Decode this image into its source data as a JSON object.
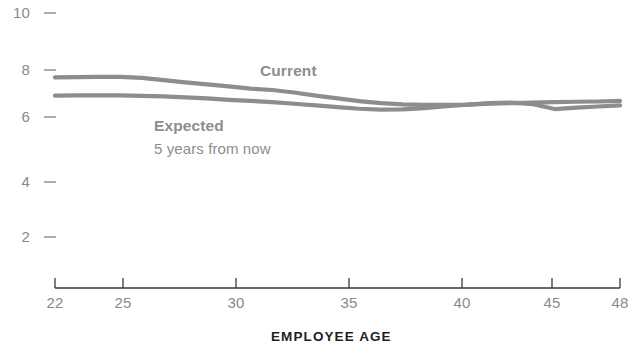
{
  "chart_data": {
    "type": "line",
    "title": "",
    "subtitle": "",
    "xlabel": "EMPLOYEE AGE",
    "ylabel": "",
    "xlim": [
      22,
      48
    ],
    "ylim": [
      0,
      10.6
    ],
    "grid": false,
    "legend_position": "inline-annotations",
    "x_ticks": [
      "22",
      "25",
      "30",
      "35",
      "40",
      "45",
      "48"
    ],
    "x_tick_values": [
      22,
      25,
      30,
      35,
      40,
      45,
      48
    ],
    "y_ticks": [
      "10",
      "8",
      "6",
      "4",
      "2"
    ],
    "y_tick_values": [
      10,
      8,
      6,
      4,
      2
    ],
    "x": [
      22,
      23,
      24,
      25,
      26,
      27,
      28,
      29,
      30,
      31,
      32,
      33,
      34,
      35,
      36,
      37,
      38,
      39,
      40,
      41,
      42,
      43,
      44,
      45,
      46,
      47,
      48
    ],
    "series": [
      {
        "name": "Current",
        "color": "#8d8d8d",
        "values": [
          7.7,
          7.71,
          7.72,
          7.72,
          7.68,
          7.6,
          7.52,
          7.45,
          7.38,
          7.3,
          7.25,
          7.16,
          7.05,
          6.95,
          6.85,
          6.78,
          6.74,
          6.72,
          6.72,
          6.73,
          6.76,
          6.78,
          6.8,
          6.82,
          6.83,
          6.84,
          6.86
        ]
      },
      {
        "name": "Expected",
        "color": "#8d8d8d",
        "values": [
          7.05,
          7.06,
          7.06,
          7.06,
          7.04,
          7.02,
          6.99,
          6.95,
          6.9,
          6.86,
          6.82,
          6.76,
          6.7,
          6.64,
          6.58,
          6.55,
          6.56,
          6.6,
          6.67,
          6.73,
          6.78,
          6.8,
          6.74,
          6.57,
          6.62,
          6.66,
          6.7
        ]
      }
    ],
    "annotations": [
      {
        "id": "current",
        "label": "Current",
        "sublabel": "",
        "x_px": 260,
        "y_px": 62
      },
      {
        "id": "expected",
        "label": "Expected",
        "sublabel": "5 years from now",
        "x_px": 154,
        "y_px": 117
      }
    ],
    "colors": {
      "line": "#8d8d8d",
      "axis": "#3a3a3a",
      "tick_text": "#8a8a8a",
      "axis_title": "#1f1f1f",
      "background": "#ffffff"
    }
  }
}
